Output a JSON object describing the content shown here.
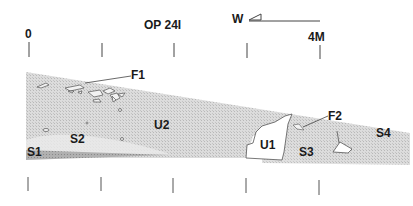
{
  "title": "OP 24I",
  "scale": {
    "start": "0",
    "end": "4M"
  },
  "orientation": {
    "label": "W"
  },
  "layers": {
    "F1": "F1",
    "F2": "F2",
    "U1": "U1",
    "U2": "U2",
    "S1": "S1",
    "S2": "S2",
    "S3": "S3",
    "S4": "S4"
  },
  "colors": {
    "fill_light": "#d9d9d9",
    "fill_dark": "#a9a9a9",
    "line": "#333333"
  }
}
